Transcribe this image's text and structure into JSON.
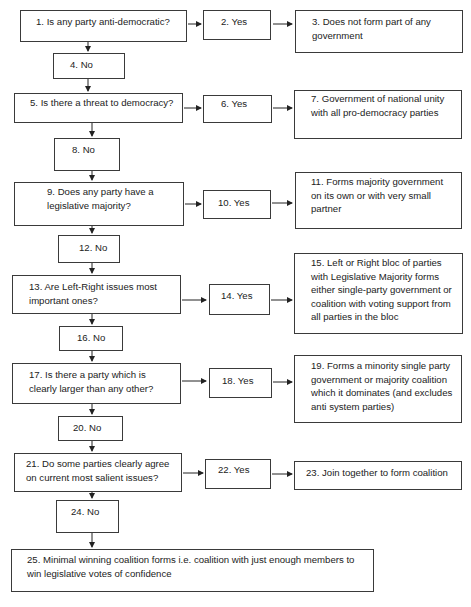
{
  "diagram": {
    "type": "flowchart",
    "nodes": [
      {
        "id": 1,
        "text": "1.   Is any party anti-democratic?"
      },
      {
        "id": 2,
        "text": "2. Yes"
      },
      {
        "id": 3,
        "text": "3. Does not form part of any\ngovernment"
      },
      {
        "id": 4,
        "text": "4.   No"
      },
      {
        "id": 5,
        "text": "5. Is there a threat to democracy?"
      },
      {
        "id": 6,
        "text": "6. Yes"
      },
      {
        "id": 7,
        "text": "7. Government of national unity\nwith all pro-democracy parties"
      },
      {
        "id": 8,
        "text": "8. No"
      },
      {
        "id": 9,
        "text": "9. Does any party have a\nlegislative majority?"
      },
      {
        "id": 10,
        "text": "10. Yes"
      },
      {
        "id": 11,
        "text": "11. Forms majority government\non its own or with very small\npartner"
      },
      {
        "id": 12,
        "text": "12. No"
      },
      {
        "id": 13,
        "text": "13. Are Left-Right issues most\nimportant ones?"
      },
      {
        "id": 14,
        "text": "14. Yes"
      },
      {
        "id": 15,
        "text": "15. Left or Right bloc of parties\nwith Legislative Majority forms\neither single-party government or\ncoalition with voting support from\nall parties in the bloc"
      },
      {
        "id": 16,
        "text": "16. No"
      },
      {
        "id": 17,
        "text": "17. Is there a party which is\nclearly larger than any other?"
      },
      {
        "id": 18,
        "text": "18. Yes"
      },
      {
        "id": 19,
        "text": "19. Forms a minority single party\ngovernment or majority coalition\nwhich it dominates (and excludes\nanti system parties)"
      },
      {
        "id": 20,
        "text": "20. No"
      },
      {
        "id": 21,
        "text": "21. Do some parties clearly agree\non current most salient issues?"
      },
      {
        "id": 22,
        "text": "22. Yes"
      },
      {
        "id": 23,
        "text": "23. Join together to form coalition"
      },
      {
        "id": 24,
        "text": "24. No"
      },
      {
        "id": 25,
        "text": "25. Minimal winning coalition forms i.e. coalition with just enough members to\nwin legislative votes of confidence"
      }
    ],
    "edges": [
      [
        1,
        2
      ],
      [
        2,
        3
      ],
      [
        1,
        4
      ],
      [
        4,
        5
      ],
      [
        5,
        6
      ],
      [
        6,
        7
      ],
      [
        5,
        8
      ],
      [
        8,
        9
      ],
      [
        9,
        10
      ],
      [
        10,
        11
      ],
      [
        9,
        12
      ],
      [
        12,
        13
      ],
      [
        13,
        14
      ],
      [
        14,
        15
      ],
      [
        13,
        16
      ],
      [
        16,
        17
      ],
      [
        17,
        18
      ],
      [
        18,
        19
      ],
      [
        17,
        20
      ],
      [
        20,
        21
      ],
      [
        21,
        22
      ],
      [
        22,
        23
      ],
      [
        21,
        24
      ],
      [
        24,
        25
      ]
    ]
  }
}
